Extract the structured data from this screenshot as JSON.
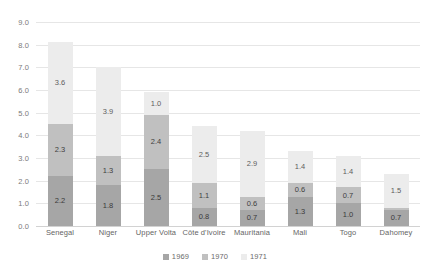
{
  "chart_data": {
    "type": "bar",
    "subtype": "stacked-bar",
    "title": "",
    "xlabel": "",
    "ylabel": "",
    "ylim": [
      0.0,
      9.0
    ],
    "ytick_step": 1.0,
    "ytick_labels": [
      "9.0",
      "8.0",
      "7.0",
      "6.0",
      "5.0",
      "4.0",
      "3.0",
      "2.0",
      "1.0",
      "0.0"
    ],
    "ytick_values": [
      9.0,
      8.0,
      7.0,
      6.0,
      5.0,
      4.0,
      3.0,
      2.0,
      1.0,
      0.0
    ],
    "grid": true,
    "legend_position": "bottom",
    "categories": [
      "Senegal",
      "Niger",
      "Upper Volta",
      "Côte d'Ivoire",
      "Mauritania",
      "Mali",
      "Togo",
      "Dahomey"
    ],
    "series": [
      {
        "name": "1969",
        "color": "#a6a6a6",
        "values": [
          2.2,
          1.8,
          2.5,
          0.8,
          0.7,
          1.3,
          1.0,
          0.7
        ],
        "labels": [
          "2.2",
          "1.8",
          "2.5",
          "0.8",
          "0.7",
          "1.3",
          "1.0",
          "0.7"
        ]
      },
      {
        "name": "1970",
        "color": "#c0c0c0",
        "values": [
          2.3,
          1.3,
          2.4,
          1.1,
          0.6,
          0.6,
          0.7,
          0.1
        ],
        "labels": [
          "2.3",
          "1.3",
          "2.4",
          "1.1",
          "0.6",
          "0.6",
          "0.7",
          "0.1"
        ]
      },
      {
        "name": "1971",
        "color": "#ececec",
        "values": [
          3.6,
          3.9,
          1.0,
          2.5,
          2.9,
          1.4,
          1.4,
          1.5
        ],
        "labels": [
          "3.6",
          "3.9",
          "1.0",
          "2.5",
          "2.9",
          "1.4",
          "1.4",
          "1.5"
        ]
      }
    ],
    "totals": [
      8.1,
      7.0,
      5.9,
      4.4,
      4.2,
      3.3,
      3.1,
      2.3
    ]
  },
  "legend": {
    "items": [
      {
        "label": "1969",
        "color": "#a6a6a6"
      },
      {
        "label": "1970",
        "color": "#c0c0c0"
      },
      {
        "label": "1971",
        "color": "#ececec"
      }
    ]
  },
  "colors": {
    "grid": "#e6e6e6",
    "axis": "#d2d2d2",
    "tick_text": "#7b7b7b",
    "background": "#ffffff"
  }
}
